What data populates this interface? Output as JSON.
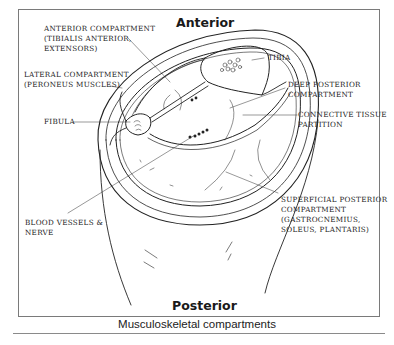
{
  "diagram": {
    "orientation": {
      "top": "Anterior",
      "bottom": "Posterior"
    },
    "labels": {
      "anterior_compartment": [
        "Anterior Compartment",
        "(Tibialis Anterior,",
        "Extensors)"
      ],
      "lateral_compartment": [
        "Lateral Compartment",
        "(Peroneus Muscles)"
      ],
      "fibula": [
        "Fibula"
      ],
      "blood_vessels": [
        "Blood Vessels &",
        "Nerve"
      ],
      "tibia": [
        "Tibia"
      ],
      "deep_posterior": [
        "Deep Posterior",
        "Compartment"
      ],
      "connective_tissue": [
        "Connective Tissue",
        "Partition"
      ],
      "superficial_posterior": [
        "Superficial Posterior",
        "Compartment",
        "(Gastrocnemius,",
        "Soleus, Plantaris)"
      ]
    },
    "caption": "Musculoskeletal compartments",
    "colors": {
      "ink": "#222222",
      "frame": "#7a7a7a",
      "background": "#ffffff"
    }
  }
}
